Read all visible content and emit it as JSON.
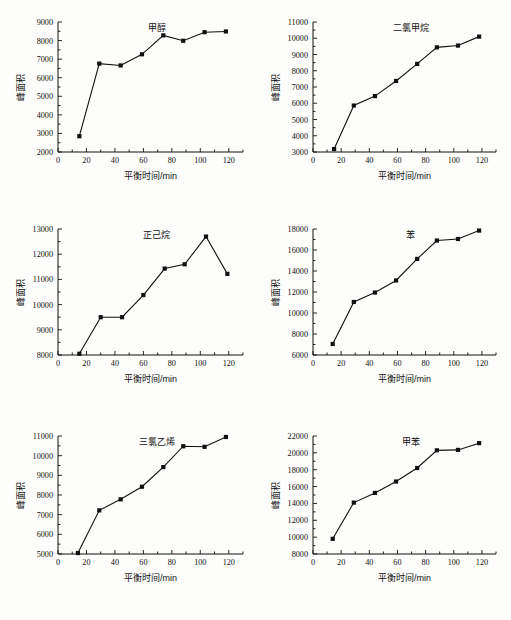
{
  "figure": {
    "layout": "2 columns x 3 rows of line charts",
    "shared_xlabel": "平衡时间/min",
    "shared_ylabel": "峰面积"
  },
  "chart_data": [
    {
      "type": "line",
      "title": "甲醇",
      "xlabel": "平衡时间/min",
      "ylabel": "峰面积",
      "x": [
        15,
        29,
        44,
        59,
        74,
        88,
        103,
        118
      ],
      "values": [
        2850,
        6760,
        6660,
        7260,
        8280,
        7990,
        8450,
        8490
      ],
      "xlim": [
        0,
        130
      ],
      "ylim": [
        2000,
        9000
      ],
      "xticks": [
        0,
        20,
        40,
        60,
        80,
        100,
        120
      ],
      "yticks": [
        2000,
        3000,
        4000,
        5000,
        6000,
        7000,
        8000,
        9000
      ],
      "xticklabels": [
        "0",
        "20",
        "40",
        "60",
        "80",
        "100",
        "120"
      ],
      "yticklabels": [
        "2000",
        "3000",
        "4000",
        "5000",
        "6000",
        "7000",
        "8000",
        "9000"
      ],
      "grid": false,
      "legend": "none",
      "marker": "square"
    },
    {
      "type": "line",
      "title": "二氯甲烷",
      "xlabel": "平衡时间/min",
      "ylabel": "峰面积",
      "x": [
        15,
        29,
        44,
        59,
        74,
        88,
        103,
        118
      ],
      "values": [
        3180,
        5860,
        6440,
        7370,
        8420,
        9440,
        9550,
        10100
      ],
      "xlim": [
        0,
        130
      ],
      "ylim": [
        3000,
        11000
      ],
      "xticks": [
        0,
        20,
        40,
        60,
        80,
        100,
        120
      ],
      "yticks": [
        3000,
        4000,
        5000,
        6000,
        7000,
        8000,
        9000,
        10000,
        11000
      ],
      "xticklabels": [
        "0",
        "20",
        "40",
        "60",
        "80",
        "100",
        "120"
      ],
      "yticklabels": [
        "3000",
        "4000",
        "5000",
        "6000",
        "7000",
        "8000",
        "9000",
        "10000",
        "11000"
      ],
      "grid": false,
      "legend": "none",
      "marker": "square"
    },
    {
      "type": "line",
      "title": "正己烷",
      "xlabel": "平衡时间/min",
      "ylabel": "峰面积",
      "x": [
        15,
        30,
        45,
        60,
        75,
        89,
        104,
        119
      ],
      "values": [
        8050,
        9500,
        9500,
        10380,
        11430,
        11600,
        12700,
        11220
      ],
      "xlim": [
        0,
        130
      ],
      "ylim": [
        8000,
        13000
      ],
      "xticks": [
        0,
        20,
        40,
        60,
        80,
        100,
        120
      ],
      "yticks": [
        8000,
        9000,
        10000,
        11000,
        12000,
        13000
      ],
      "xticklabels": [
        "0",
        "20",
        "40",
        "60",
        "80",
        "100",
        "120"
      ],
      "yticklabels": [
        "8000",
        "9000",
        "10000",
        "11000",
        "12000",
        "13000"
      ],
      "grid": false,
      "legend": "none",
      "marker": "square"
    },
    {
      "type": "line",
      "title": "苯",
      "xlabel": "平衡时间/min",
      "ylabel": "峰面积",
      "x": [
        14,
        29,
        44,
        59,
        74,
        88,
        103,
        118
      ],
      "values": [
        7050,
        11050,
        11950,
        13100,
        15150,
        16900,
        17050,
        17850
      ],
      "xlim": [
        0,
        130
      ],
      "ylim": [
        6000,
        18000
      ],
      "xticks": [
        0,
        20,
        40,
        60,
        80,
        100,
        120
      ],
      "yticks": [
        6000,
        8000,
        10000,
        12000,
        14000,
        16000,
        18000
      ],
      "xticklabels": [
        "0",
        "20",
        "40",
        "60",
        "80",
        "100",
        "120"
      ],
      "yticklabels": [
        "6000",
        "8000",
        "10000",
        "12000",
        "14000",
        "16000",
        "18000"
      ],
      "grid": false,
      "legend": "none",
      "marker": "square"
    },
    {
      "type": "line",
      "title": "三氯乙烯",
      "xlabel": "平衡时间/min",
      "ylabel": "峰面积",
      "x": [
        14,
        29,
        44,
        59,
        74,
        88,
        103,
        118
      ],
      "values": [
        5050,
        7220,
        7780,
        8420,
        9420,
        10480,
        10450,
        10950
      ],
      "xlim": [
        0,
        130
      ],
      "ylim": [
        5000,
        11000
      ],
      "xticks": [
        0,
        20,
        40,
        60,
        80,
        100,
        120
      ],
      "yticks": [
        5000,
        6000,
        7000,
        8000,
        9000,
        10000,
        11000
      ],
      "xticklabels": [
        "0",
        "20",
        "40",
        "60",
        "80",
        "100",
        "120"
      ],
      "yticklabels": [
        "5000",
        "6000",
        "7000",
        "8000",
        "9000",
        "10000",
        "11000"
      ],
      "grid": false,
      "legend": "none",
      "marker": "square"
    },
    {
      "type": "line",
      "title": "甲苯",
      "xlabel": "平衡时间/min",
      "ylabel": "峰面积",
      "x": [
        14,
        29,
        44,
        59,
        74,
        88,
        103,
        118
      ],
      "values": [
        9800,
        14100,
        15250,
        16600,
        18200,
        20300,
        20350,
        21150
      ],
      "xlim": [
        0,
        130
      ],
      "ylim": [
        8000,
        22000
      ],
      "xticks": [
        0,
        20,
        40,
        60,
        80,
        100,
        120
      ],
      "yticks": [
        8000,
        10000,
        12000,
        14000,
        16000,
        18000,
        20000,
        22000
      ],
      "xticklabels": [
        "0",
        "20",
        "40",
        "60",
        "80",
        "100",
        "120"
      ],
      "yticklabels": [
        "8000",
        "10000",
        "12000",
        "14000",
        "16000",
        "18000",
        "20000",
        "22000"
      ],
      "grid": false,
      "legend": "none",
      "marker": "square"
    }
  ]
}
